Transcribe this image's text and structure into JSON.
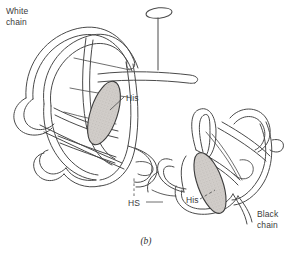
{
  "figure": {
    "caption": "(b)",
    "background_color": "#ffffff",
    "line_color": "#4a4a4a",
    "heme_fill_color": "#cdc9c5",
    "heme_outline_color": "#3c3c3c",
    "text_color": "#3b3b3b",
    "width": 292,
    "height": 254
  },
  "labels": {
    "white_chain": "White\nchain",
    "white_chain_line1": "White",
    "white_chain_line2": "chain",
    "black_chain_line1": "Black",
    "black_chain_line2": "chain",
    "his_left": "His",
    "his_right": "His",
    "hs": "HS"
  },
  "elements": {
    "white_chain_name": "white-chain-ribbon",
    "black_chain_name": "black-chain-ribbon",
    "heme_left_name": "heme-group-left",
    "heme_right_name": "heme-group-right",
    "oxygen_ellipse_name": "top-ligand-ellipse"
  }
}
